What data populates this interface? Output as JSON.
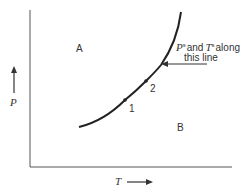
{
  "diagram": {
    "region_labels": {
      "a": "A",
      "b": "B"
    },
    "points": {
      "p1": "1",
      "p2": "2"
    },
    "annotation": {
      "line1_p": "P",
      "line1_sup1": "s",
      "line1_mid": "and",
      "line1_t": "T",
      "line1_sup2": "s",
      "line1_end": "along",
      "line2": "this line"
    },
    "axes": {
      "y_label": "P",
      "x_label": "T"
    },
    "colors": {
      "stroke": "#222222",
      "axis": "#555555",
      "text": "#333333"
    }
  }
}
